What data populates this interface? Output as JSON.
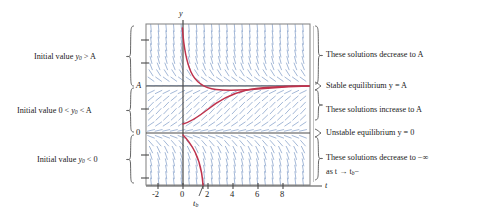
{
  "figure": {
    "type": "slope-field-with-solutions",
    "axis": {
      "x_label": "t",
      "y_label": "y",
      "x_ticks": [
        "-2",
        "0",
        "2",
        "4",
        "6",
        "8"
      ],
      "x_tick_values": [
        -2,
        0,
        2,
        4,
        6,
        8
      ],
      "x_range": [
        -3,
        9
      ],
      "y_range": [
        -2.4,
        3.2
      ],
      "y_marked_values": [
        "A",
        "0"
      ],
      "breakpoint_label": "t",
      "breakpoint_sub": "b",
      "breakpoint_value": 1.6
    },
    "equilibria": [
      {
        "name": "stable",
        "label": "Stable equilibrium y = A",
        "y_value": "A"
      },
      {
        "name": "unstable",
        "label": "Unstable equilibrium y = 0",
        "y_value": "0"
      }
    ],
    "left_annotations": [
      {
        "id": "above-A",
        "text_prefix": "Initial value ",
        "var": "y",
        "sub": "0",
        "relation": " > A"
      },
      {
        "id": "between-0-A",
        "text_prefix": "Initial value 0 < ",
        "var": "y",
        "sub": "0",
        "relation": " < A"
      },
      {
        "id": "below-0",
        "text_prefix": "Initial value ",
        "var": "y",
        "sub": "0",
        "relation": " < 0"
      }
    ],
    "right_annotations": [
      {
        "id": "decrease-to-A",
        "line1": "These solutions decrease to A",
        "line2": ""
      },
      {
        "id": "stable-eq",
        "line1": "Stable equilibrium y = A",
        "line2": ""
      },
      {
        "id": "increase-to-A",
        "line1": "These solutions increase to A",
        "line2": ""
      },
      {
        "id": "unstable-eq",
        "line1": "Unstable equilibrium y = 0",
        "line2": ""
      },
      {
        "id": "decrease-to-neg-inf",
        "line1": "These solutions decrease to −∞",
        "line2": "as t → t"
      }
    ],
    "colors": {
      "solution_curve": "#c0334d",
      "slope_field": "#8fa8cc",
      "frame": "#808080",
      "axis": "#555555",
      "text": "#1a1a1a",
      "plot_background": "#ffffff"
    }
  },
  "chart_data": {
    "type": "line",
    "title": "",
    "xlabel": "t",
    "ylabel": "y",
    "xlim": [
      -3,
      9
    ],
    "ylim": [
      -2.4,
      3.2
    ],
    "grid": false,
    "legend": "none",
    "annotations": [
      "Initial value y0 > A",
      "Initial value 0 < y0 < A",
      "Initial value y0 < 0",
      "These solutions decrease to A",
      "Stable equilibrium y = A",
      "These solutions increase to A",
      "Unstable equilibrium y = 0",
      "These solutions decrease to -inf as t -> tb-"
    ],
    "equilibrium_lines": [
      {
        "label": "A",
        "y": 1.0,
        "stability": "stable"
      },
      {
        "label": "0",
        "y": 0.0,
        "stability": "unstable"
      }
    ],
    "series": [
      {
        "name": "solution-above-A",
        "description": "starts at y0 > A near t=0, decreases asymptotically to A",
        "x": [
          -0.05,
          0.1,
          0.3,
          0.55,
          0.85,
          1.2,
          1.7,
          2.3,
          3.1,
          4.2,
          5.5,
          7.0,
          8.6
        ],
        "y": [
          3.05,
          2.55,
          2.05,
          1.73,
          1.5,
          1.34,
          1.2,
          1.12,
          1.07,
          1.04,
          1.02,
          1.01,
          1.0
        ]
      },
      {
        "name": "solution-between-0-and-A",
        "description": "starts at 0 < y0 < A near t=0, increases asymptotically to A",
        "x": [
          0.0,
          0.5,
          1.1,
          1.8,
          2.6,
          3.5,
          4.5,
          5.6,
          6.8,
          8.0,
          8.6
        ],
        "y": [
          0.2,
          0.26,
          0.35,
          0.48,
          0.63,
          0.77,
          0.87,
          0.93,
          0.97,
          0.99,
          1.0
        ]
      },
      {
        "name": "solution-below-0",
        "description": "starts at y0 < 0 near t=0, decreases to -infinity as t approaches tb from the left",
        "x": [
          0.0,
          0.25,
          0.55,
          0.85,
          1.1,
          1.3,
          1.45,
          1.55,
          1.6
        ],
        "y": [
          -0.05,
          -0.2,
          -0.45,
          -0.8,
          -1.15,
          -1.55,
          -1.95,
          -2.2,
          -2.4
        ]
      }
    ]
  }
}
